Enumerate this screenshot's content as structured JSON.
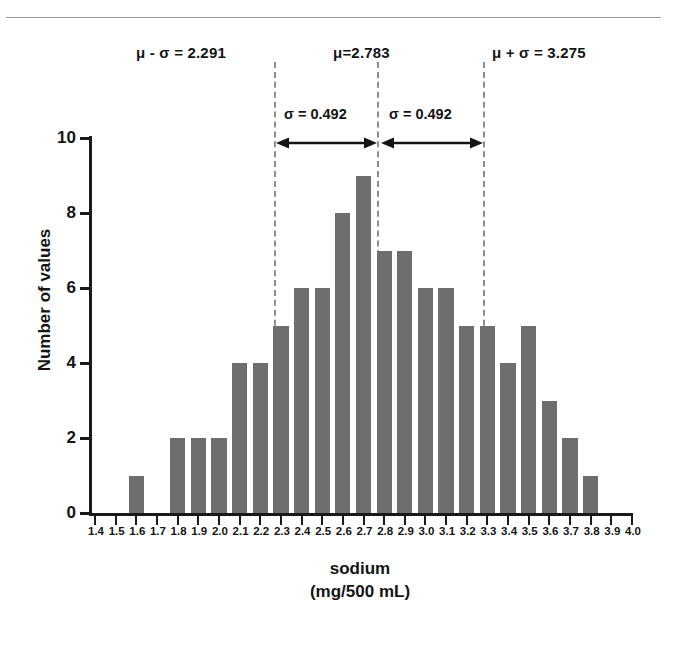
{
  "chart_data": {
    "type": "bar",
    "title": "",
    "xlabel": "sodium",
    "xlabel_units": "(mg/500 mL)",
    "ylabel": "Number of values",
    "xlim": [
      1.4,
      4.0
    ],
    "ylim": [
      0,
      10
    ],
    "grid": false,
    "legend": "none",
    "bar_color": "#6e6e6e",
    "axis_color": "#1a1a1a",
    "annotation_line_color": "#8e8e8e",
    "x_tick_labels": [
      "1.4",
      "1.5",
      "1.6",
      "1.7",
      "1.8",
      "1.9",
      "2.0",
      "2.1",
      "2.2",
      "2.3",
      "2.4",
      "2.5",
      "2.6",
      "2.7",
      "2.8",
      "2.9",
      "3.0",
      "3.1",
      "3.2",
      "3.3",
      "3.4",
      "3.5",
      "3.6",
      "3.7",
      "3.8",
      "3.9",
      "4.0"
    ],
    "y_tick_labels": [
      "0",
      "2",
      "4",
      "6",
      "8",
      "10"
    ],
    "y_ticks": [
      0,
      2,
      4,
      6,
      8,
      10
    ],
    "categories": [
      "1.4",
      "1.5",
      "1.6",
      "1.7",
      "1.8",
      "1.9",
      "2.0",
      "2.1",
      "2.2",
      "2.3",
      "2.4",
      "2.5",
      "2.6",
      "2.7",
      "2.8",
      "2.9",
      "3.0",
      "3.1",
      "3.2",
      "3.3",
      "3.4",
      "3.5",
      "3.6",
      "3.7",
      "3.8",
      "3.9",
      "4.0"
    ],
    "values": [
      0,
      0,
      1,
      0,
      2,
      2,
      2,
      4,
      4,
      5,
      6,
      6,
      8,
      9,
      7,
      7,
      6,
      6,
      5,
      5,
      4,
      5,
      3,
      2,
      1,
      0,
      0
    ],
    "annotations": {
      "mean_minus_sd_label": "μ - σ = 2.291",
      "mean_label": "μ=2.783",
      "mean_plus_sd_label": "μ + σ = 3.275",
      "sigma_left_label": "σ = 0.492",
      "sigma_right_label": "σ = 0.492",
      "mean_minus_sd_value": 2.291,
      "mean_value": 2.783,
      "mean_plus_sd_value": 3.275,
      "sigma_value": 0.492
    }
  }
}
